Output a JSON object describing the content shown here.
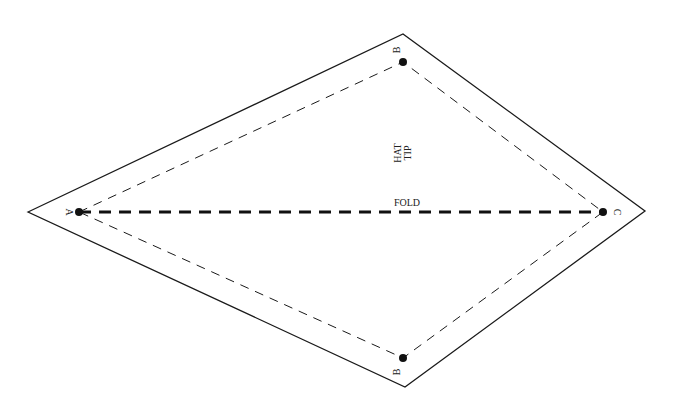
{
  "diagram": {
    "type": "sewing-pattern",
    "labels": {
      "tip": [
        "HAT",
        "TIP"
      ],
      "fold": "FOLD",
      "point_a": "A",
      "point_b_top": "B",
      "point_b_bottom": "B",
      "point_c": "C"
    },
    "colors": {
      "line": "#1a1a1a",
      "background": "#ffffff"
    }
  }
}
